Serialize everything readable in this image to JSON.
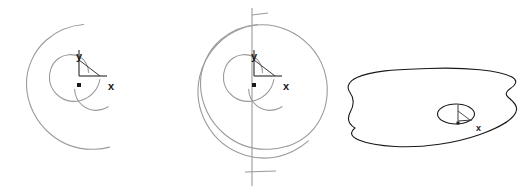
{
  "figure": {
    "title": "",
    "background_color": "#ffffff",
    "panel_count": 3,
    "panels": [
      {
        "id": "panel-left",
        "name": "spiral-partial",
        "curve_color": "#9a9a9a",
        "curve_width": 1.1,
        "axis_color": "#3a3a3a",
        "axis_width": 1.2,
        "origin": {
          "x": 82,
          "y": 81
        },
        "axes": {
          "x_label": "x",
          "y_label": "y",
          "x_label_pos": {
            "x": 110,
            "y": 86
          },
          "y_label_pos": {
            "x": 80,
            "y": 58
          },
          "x_axis_end": {
            "x": 104,
            "y": 76
          },
          "y_axis_end": {
            "x": 79,
            "y": 50
          },
          "diagonal_end": {
            "x": 100,
            "y": 76
          },
          "origin_marker_size": 3.5
        },
        "spiral": {
          "type": "archimedean",
          "turns": 1.85,
          "center": {
            "x": 62,
            "y": 70
          },
          "a": 2.0,
          "b": 8.6,
          "theta_start": 0.35,
          "theta_end": 12.2,
          "rotation_deg": -104
        }
      },
      {
        "id": "panel-middle",
        "name": "spiral-full",
        "curve_color": "#9a9a9a",
        "curve_width": 1.1,
        "axis_color": "#3a3a3a",
        "axis_width": 1.2,
        "origin": {
          "x": 257,
          "y": 81
        },
        "axes": {
          "x_label": "x",
          "y_label": "y",
          "x_label_pos": {
            "x": 286,
            "y": 86
          },
          "y_label_pos": {
            "x": 255,
            "y": 58
          },
          "x_axis_end": {
            "x": 279,
            "y": 76
          },
          "y_axis_end": {
            "x": 254,
            "y": 50
          },
          "diagonal_end": {
            "x": 275,
            "y": 76
          },
          "origin_marker_size": 3.5,
          "vertical_guide": {
            "x": 252,
            "y_top": 8,
            "y_bottom": 186
          },
          "tick_top": {
            "x1": 252,
            "x2": 266,
            "y": 15
          },
          "tick_bottom": {
            "x1": 247,
            "x2": 272,
            "y": 172
          }
        },
        "spiral": {
          "type": "archimedean",
          "turns": 2.6,
          "center": {
            "x": 240,
            "y": 72
          },
          "a": 2.0,
          "b": 8.6,
          "theta_start": 0.35,
          "theta_end": 16.8,
          "rotation_deg": -104
        }
      },
      {
        "id": "panel-right",
        "name": "blob-with-inner-ellipse",
        "curve_color": "#1a1a1a",
        "curve_width": 1.1,
        "axis_color": "#3a3a3a",
        "axis_width": 1.0,
        "origin": {
          "x": 458,
          "y": 123
        },
        "axes": {
          "x_label": "x",
          "y_label": "",
          "x_label_pos": {
            "x": 478,
            "y": 128
          },
          "origin_marker_size": 2.5
        },
        "outer_blob": {
          "center": {
            "x": 434,
            "y": 117
          },
          "rx": 92,
          "ry": 49,
          "lobe_count": 2
        },
        "inner_ellipse": {
          "center": {
            "x": 456,
            "y": 114
          },
          "rx": 18,
          "ry": 10
        }
      }
    ]
  },
  "labels": {
    "x": "x",
    "y": "y"
  },
  "colors": {
    "spiral_gray": "#9a9a9a",
    "blob_black": "#1a1a1a",
    "axis_dark": "#3a3a3a",
    "background": "#ffffff"
  }
}
